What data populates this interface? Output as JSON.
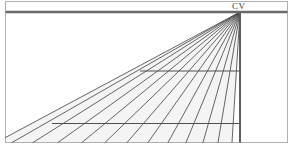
{
  "figure": {
    "background_color": "#ffffff"
  },
  "frame": {
    "name": "picture-plane-border",
    "x": 5.5,
    "y": 1.5,
    "width": 282,
    "height": 141,
    "stroke": "#b0b0b0",
    "stroke_width": 1
  },
  "horizon": {
    "label": "horizon-line",
    "y": 12,
    "x_start": 5.5,
    "x_end": 287.5,
    "stroke": "#6a6a6a",
    "stroke_width": 2.6
  },
  "vanishing_point": {
    "label": "CV",
    "description": "center of vision",
    "x": 240,
    "y": 12,
    "label_x": 232,
    "label_y": 2,
    "color": "#3a3a3a"
  },
  "vertical_line": {
    "name": "central-vertical-line",
    "x": 240,
    "y_start": 12,
    "y_end": 142.5,
    "stroke": "#585858",
    "stroke_width": 1.9
  },
  "convergence_lines": {
    "name": "orthogonal-lines",
    "count": 13,
    "stroke": "#4a4a4a",
    "stroke_width": 0.85,
    "origin_x": 240,
    "origin_y": 12,
    "endpoints": [
      {
        "x": 232,
        "y": 142.5
      },
      {
        "x": 218,
        "y": 142.5
      },
      {
        "x": 203,
        "y": 142.5
      },
      {
        "x": 186,
        "y": 142.5
      },
      {
        "x": 168,
        "y": 142.5
      },
      {
        "x": 148,
        "y": 142.5
      },
      {
        "x": 127,
        "y": 142.5
      },
      {
        "x": 105,
        "y": 142.5
      },
      {
        "x": 82,
        "y": 142.5
      },
      {
        "x": 58,
        "y": 142.5
      },
      {
        "x": 33,
        "y": 142.5
      },
      {
        "x": 12,
        "y": 142.5
      },
      {
        "x": 5.5,
        "y": 137.5
      }
    ]
  },
  "shading": {
    "name": "ground-plane-shading",
    "fill": "#f2f2f2",
    "opacity": 0.85
  },
  "transversals": {
    "name": "transversal-lines",
    "stroke": "#4f4f4f",
    "stroke_width": 1.15,
    "lines": [
      {
        "id": "transversal-near",
        "y": 123.5,
        "x_start": 52,
        "x_end": 240
      },
      {
        "id": "transversal-far",
        "y": 71,
        "x_start": 140,
        "x_end": 240
      }
    ]
  }
}
